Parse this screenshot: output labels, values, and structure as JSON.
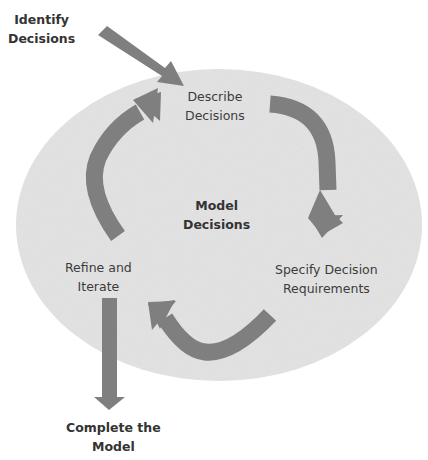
{
  "diagram": {
    "colors": {
      "background": "#ffffff",
      "ellipse_fill": "#e4e4e4",
      "arrow_fill": "#7f7f7f",
      "text": "#3c3c3c"
    },
    "center": {
      "line1": "Model",
      "line2": "Decisions"
    },
    "nodes": [
      {
        "id": "identify",
        "line1": "Identify",
        "line2": "Decisions",
        "bold": true
      },
      {
        "id": "describe",
        "line1": "Describe",
        "line2": "Decisions",
        "bold": false
      },
      {
        "id": "specify",
        "line1": "Specify Decision",
        "line2": "Requirements",
        "bold": false
      },
      {
        "id": "refine",
        "line1": "Refine and",
        "line2": "Iterate",
        "bold": false
      },
      {
        "id": "complete",
        "line1": "Complete the",
        "line2": "Model",
        "bold": true
      }
    ],
    "edges": [
      {
        "from": "identify",
        "to": "describe",
        "shape": "straight"
      },
      {
        "from": "describe",
        "to": "specify",
        "shape": "curved"
      },
      {
        "from": "specify",
        "to": "refine",
        "shape": "curved"
      },
      {
        "from": "refine",
        "to": "describe",
        "shape": "curved"
      },
      {
        "from": "refine",
        "to": "complete",
        "shape": "straight"
      }
    ]
  }
}
